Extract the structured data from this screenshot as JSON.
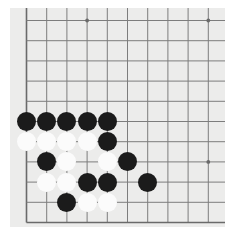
{
  "board": {
    "name": "go-board",
    "game": "Go",
    "background_color": "#ffffff",
    "board_color": "#ececeb",
    "line_color": "#7d7d7d",
    "edge_color": "#6a6a6a",
    "black_color": "#1b1b1b",
    "white_color": "#fbfbfb",
    "grid_spacing": 20.2,
    "origin_x": 16.5,
    "origin_y": 12.5,
    "cols": 10,
    "rows": 10,
    "stone_radius": 9.6,
    "star_points": [
      {
        "col": 3,
        "row": 0
      },
      {
        "col": 9,
        "row": 0
      },
      {
        "col": 9,
        "row": 7
      }
    ],
    "edges": {
      "left": true,
      "bottom": true,
      "top": false,
      "right": false
    }
  },
  "stones": [
    {
      "id": "b1",
      "color": "black",
      "col": 0,
      "row": 5
    },
    {
      "id": "b2",
      "color": "black",
      "col": 1,
      "row": 5
    },
    {
      "id": "b3",
      "color": "black",
      "col": 2,
      "row": 5
    },
    {
      "id": "b4",
      "color": "black",
      "col": 3,
      "row": 5
    },
    {
      "id": "b5",
      "color": "black",
      "col": 4,
      "row": 5
    },
    {
      "id": "w1",
      "color": "white",
      "col": 0,
      "row": 6
    },
    {
      "id": "w2",
      "color": "white",
      "col": 1,
      "row": 6
    },
    {
      "id": "w3",
      "color": "white",
      "col": 2,
      "row": 6
    },
    {
      "id": "w4",
      "color": "white",
      "col": 3,
      "row": 6
    },
    {
      "id": "b6",
      "color": "black",
      "col": 4,
      "row": 6
    },
    {
      "id": "b7",
      "color": "black",
      "col": 1,
      "row": 7
    },
    {
      "id": "w5",
      "color": "white",
      "col": 2,
      "row": 7
    },
    {
      "id": "w6",
      "color": "white",
      "col": 4,
      "row": 7
    },
    {
      "id": "b8",
      "color": "black",
      "col": 5,
      "row": 7
    },
    {
      "id": "w7",
      "color": "white",
      "col": 1,
      "row": 8
    },
    {
      "id": "w8",
      "color": "white",
      "col": 2,
      "row": 8
    },
    {
      "id": "b9",
      "color": "black",
      "col": 3,
      "row": 8
    },
    {
      "id": "b10",
      "color": "black",
      "col": 4,
      "row": 8
    },
    {
      "id": "b11",
      "color": "black",
      "col": 6,
      "row": 8
    },
    {
      "id": "b12",
      "color": "black",
      "col": 2,
      "row": 9
    },
    {
      "id": "w9",
      "color": "white",
      "col": 3,
      "row": 9
    },
    {
      "id": "w10",
      "color": "white",
      "col": 4,
      "row": 9
    }
  ],
  "counts": {
    "black_stones": 12,
    "white_stones": 10,
    "total_stones": 22
  }
}
